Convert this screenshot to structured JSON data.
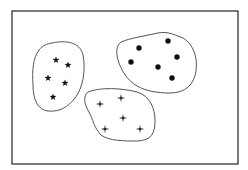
{
  "diagram": {
    "colors": {
      "background": "#ffffff",
      "frame": "#333333",
      "outline": "#555555",
      "marker": "#111111"
    },
    "frame": {
      "x": 12,
      "y": 11,
      "width": 226,
      "height": 153
    },
    "clusters": [
      {
        "name": "star-cluster",
        "marker": "star",
        "points": [
          [
            56,
            60
          ],
          [
            68,
            65
          ],
          [
            48,
            78
          ],
          [
            65,
            83
          ],
          [
            53,
            97
          ]
        ]
      },
      {
        "name": "dot-cluster",
        "marker": "dot",
        "points": [
          [
            168,
            41
          ],
          [
            139,
            48
          ],
          [
            177,
            57
          ],
          [
            131,
            62
          ],
          [
            158,
            67
          ],
          [
            172,
            78
          ]
        ]
      },
      {
        "name": "cross-cluster",
        "marker": "four-point-star",
        "points": [
          [
            100,
            104
          ],
          [
            121,
            98
          ],
          [
            123,
            118
          ],
          [
            105,
            129
          ],
          [
            140,
            129
          ]
        ]
      }
    ]
  }
}
